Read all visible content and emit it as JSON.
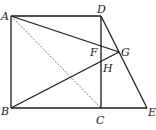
{
  "diagram": {
    "type": "geometry",
    "points": {
      "A": {
        "label": "A",
        "x": 11,
        "y": 16
      },
      "B": {
        "label": "B",
        "x": 11,
        "y": 108
      },
      "C": {
        "label": "C",
        "x": 101,
        "y": 108
      },
      "D": {
        "label": "D",
        "x": 101,
        "y": 16
      },
      "E": {
        "label": "E",
        "x": 147,
        "y": 108
      },
      "F": {
        "label": "F",
        "x": 101,
        "y": 47
      },
      "G": {
        "label": "G",
        "x": 119,
        "y": 52
      },
      "H": {
        "label": "H",
        "x": 101,
        "y": 64
      }
    },
    "segments": [
      {
        "from": "A",
        "to": "D",
        "style": "solid"
      },
      {
        "from": "A",
        "to": "B",
        "style": "solid"
      },
      {
        "from": "B",
        "to": "E",
        "style": "solid"
      },
      {
        "from": "D",
        "to": "C",
        "style": "solid"
      },
      {
        "from": "D",
        "to": "E",
        "style": "solid"
      },
      {
        "from": "A",
        "to": "G",
        "style": "solid"
      },
      {
        "from": "B",
        "to": "G",
        "style": "solid"
      },
      {
        "from": "A",
        "to": "C",
        "style": "dashed"
      }
    ],
    "line_color": "#1a1a1a",
    "dash_color": "#555555"
  }
}
